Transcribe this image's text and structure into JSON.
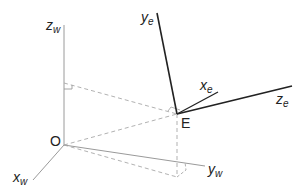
{
  "diagram": {
    "labels": {
      "zw_main": "z",
      "zw_sub": "w",
      "xw_main": "x",
      "xw_sub": "w",
      "yw_main": "y",
      "yw_sub": "w",
      "origin": "O",
      "eye": "E",
      "ye_main": "y",
      "ye_sub": "e",
      "xe_main": "x",
      "xe_sub": "e",
      "ze_main": "z",
      "ze_sub": "e"
    },
    "colors": {
      "world_axis": "#9a9a9a",
      "eye_axis": "#222222",
      "dashed": "#a8a8a8",
      "text": "#222222"
    }
  }
}
